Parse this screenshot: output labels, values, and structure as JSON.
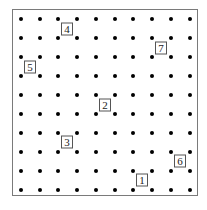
{
  "grid": {
    "columns": 10,
    "rows": 10,
    "x_positions": [
      21,
      40,
      58,
      77,
      96,
      115,
      133,
      152,
      171,
      190
    ],
    "y_positions": [
      19,
      38,
      57,
      76,
      95,
      114,
      133,
      152,
      171,
      190
    ],
    "dot_color": "#000000",
    "frame_color": "#7a7a7a"
  },
  "labels": [
    {
      "text": "4",
      "x": 67,
      "y": 29
    },
    {
      "text": "7",
      "x": 161,
      "y": 48
    },
    {
      "text": "5",
      "x": 30,
      "y": 67
    },
    {
      "text": "2",
      "x": 105,
      "y": 105
    },
    {
      "text": "3",
      "x": 67,
      "y": 142
    },
    {
      "text": "6",
      "x": 180,
      "y": 161
    },
    {
      "text": "1",
      "x": 142,
      "y": 180
    }
  ]
}
